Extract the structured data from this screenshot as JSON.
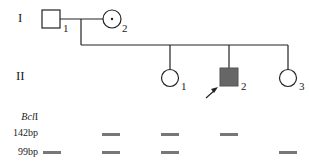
{
  "generations": [
    {
      "label": "I",
      "members": [
        {
          "id": "1",
          "sex": "male",
          "affected": false,
          "carrier": false
        },
        {
          "id": "2",
          "sex": "female",
          "affected": false,
          "carrier": true
        }
      ]
    },
    {
      "label": "II",
      "members": [
        {
          "id": "1",
          "sex": "female",
          "affected": false
        },
        {
          "id": "2",
          "sex": "male",
          "affected": true,
          "proband": true
        },
        {
          "id": "3",
          "sex": "female",
          "affected": false
        }
      ]
    }
  ],
  "gel": {
    "enzyme_label": "BclI",
    "enzyme_italic": "Bcl",
    "enzyme_suffix": "I",
    "rows": [
      {
        "label": "142bp",
        "lanes": [
          false,
          true,
          true,
          true,
          false
        ]
      },
      {
        "label": "99bp",
        "lanes": [
          true,
          true,
          true,
          false,
          true
        ]
      }
    ],
    "band_color": "#777777"
  }
}
